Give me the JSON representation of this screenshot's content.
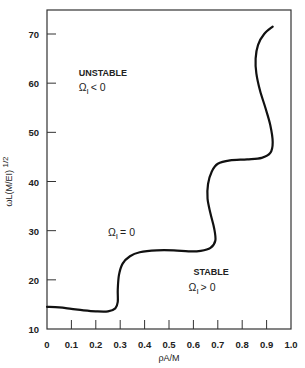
{
  "chart_data": {
    "type": "line",
    "title": "",
    "xlabel": "ρA/M",
    "ylabel": "ωL(M/EI)",
    "ylabel_superscript": "1/2",
    "xlim": [
      0,
      1.0
    ],
    "ylim": [
      10,
      75
    ],
    "x_ticks": [
      0,
      0.1,
      0.2,
      0.3,
      0.4,
      0.5,
      0.6,
      0.7,
      0.8,
      0.9,
      1.0
    ],
    "x_tick_labels": [
      "0",
      "0.1",
      "0.2",
      "0.3",
      "0.4",
      "0.5",
      "0.6",
      "0.7",
      "0.8",
      "0.9",
      "1.0"
    ],
    "y_ticks": [
      10,
      20,
      30,
      40,
      50,
      60,
      70
    ],
    "y_tick_labels": [
      "10",
      "20",
      "30",
      "40",
      "50",
      "60",
      "70"
    ],
    "grid": false,
    "legend": "none",
    "series": [
      {
        "name": "ΩI = 0",
        "points": [
          [
            0.0,
            14.5
          ],
          [
            0.05,
            14.4
          ],
          [
            0.1,
            14.1
          ],
          [
            0.15,
            13.8
          ],
          [
            0.2,
            13.6
          ],
          [
            0.25,
            13.6
          ],
          [
            0.28,
            14.2
          ],
          [
            0.29,
            15.5
          ],
          [
            0.29,
            18.0
          ],
          [
            0.295,
            21.0
          ],
          [
            0.31,
            23.3
          ],
          [
            0.34,
            24.8
          ],
          [
            0.38,
            25.6
          ],
          [
            0.45,
            26.0
          ],
          [
            0.52,
            26.0
          ],
          [
            0.58,
            25.8
          ],
          [
            0.63,
            25.9
          ],
          [
            0.67,
            26.5
          ],
          [
            0.69,
            28.0
          ],
          [
            0.685,
            30.5
          ],
          [
            0.67,
            33.5
          ],
          [
            0.658,
            36.5
          ],
          [
            0.66,
            39.5
          ],
          [
            0.675,
            42.0
          ],
          [
            0.7,
            43.6
          ],
          [
            0.75,
            44.3
          ],
          [
            0.82,
            44.5
          ],
          [
            0.88,
            44.8
          ],
          [
            0.915,
            45.8
          ],
          [
            0.925,
            48.0
          ],
          [
            0.915,
            51.5
          ],
          [
            0.895,
            55.0
          ],
          [
            0.873,
            58.5
          ],
          [
            0.858,
            62.0
          ],
          [
            0.855,
            65.0
          ],
          [
            0.865,
            67.8
          ],
          [
            0.89,
            70.0
          ],
          [
            0.925,
            71.5
          ]
        ]
      }
    ],
    "annotations": [
      {
        "text": "UNSTABLE",
        "x": 0.13,
        "y": 61.5
      },
      {
        "text": "Ω",
        "sub": "I",
        "rel": "< 0",
        "x": 0.13,
        "y": 58.5
      },
      {
        "text": "Ω",
        "sub": "I",
        "rel": "= 0",
        "x": 0.25,
        "y": 29.0
      },
      {
        "text": "STABLE",
        "x": 0.6,
        "y": 21.0
      },
      {
        "text": "Ω",
        "sub": "I",
        "rel": "> 0",
        "x": 0.58,
        "y": 17.8
      }
    ]
  }
}
